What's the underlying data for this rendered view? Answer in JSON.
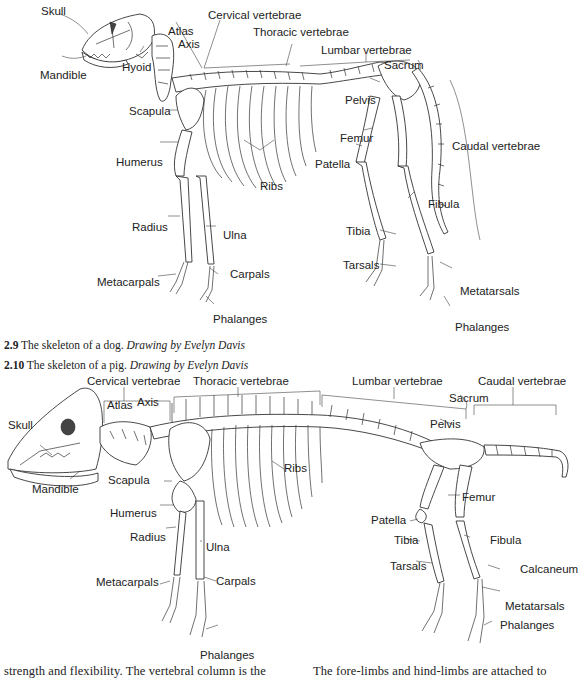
{
  "figure_dog": {
    "number": "2.9",
    "caption": "The skeleton of a dog.",
    "credit": "Drawing by Evelyn Davis",
    "labels": {
      "skull": "Skull",
      "atlas": "Atlas",
      "axis": "Axis",
      "cervical": "Cervical vertebrae",
      "thoracic": "Thoracic vertebrae",
      "lumbar": "Lumbar vertebrae",
      "sacrum": "Sacrum",
      "mandible": "Mandible",
      "hyoid": "Hyoid",
      "pelvis": "Pelvis",
      "scapula": "Scapula",
      "femur": "Femur",
      "caudal": "Caudal vertebrae",
      "humerus": "Humerus",
      "patella": "Patella",
      "ribs": "Ribs",
      "fibula": "Fibula",
      "radius": "Radius",
      "ulna": "Ulna",
      "tibia": "Tibia",
      "tarsals": "Tarsals",
      "metacarpals": "Metacarpals",
      "carpals": "Carpals",
      "metatarsals": "Metatarsals",
      "phalanges_fore": "Phalanges",
      "phalanges_hind": "Phalanges"
    }
  },
  "figure_pig": {
    "number": "2.10",
    "caption": "The skeleton of a pig.",
    "credit": "Drawing by Evelyn Davis",
    "labels": {
      "cervical": "Cervical vertebrae",
      "thoracic": "Thoracic vertebrae",
      "lumbar": "Lumbar vertebrae",
      "caudal": "Caudal vertebrae",
      "atlas": "Atlas",
      "axis": "Axis",
      "sacrum": "Sacrum",
      "skull": "Skull",
      "pelvis": "Pelvis",
      "scapula": "Scapula",
      "ribs": "Ribs",
      "patella": "Patella",
      "femur": "Femur",
      "mandible": "Mandible",
      "humerus": "Humerus",
      "radius": "Radius",
      "ulna": "Ulna",
      "tibia": "Tibia",
      "fibula": "Fibula",
      "tarsals": "Tarsals",
      "calcaneum": "Calcaneum",
      "metacarpals": "Metacarpals",
      "carpals": "Carpals",
      "metatarsals": "Metatarsals",
      "phalanges_fore": "Phalanges",
      "phalanges_hind": "Phalanges"
    }
  },
  "body_text": {
    "left_column": "strength and flexibility. The vertebral column is the",
    "right_column": "The fore-limbs and hind-limbs are attached to"
  }
}
